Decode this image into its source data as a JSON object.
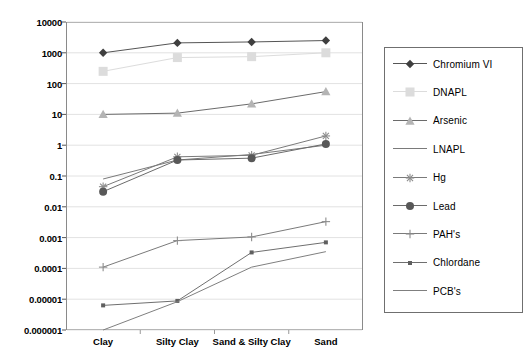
{
  "chart_data": {
    "type": "line",
    "title": "",
    "xlabel": "",
    "ylabel": "",
    "scale": "log",
    "grid": true,
    "legend_position": "right",
    "categories": [
      "Clay",
      "Silty Clay",
      "Sand & Silty Clay",
      "Sand"
    ],
    "ylim": [
      1e-06,
      10000
    ],
    "ytick_labels": [
      "10000",
      "1000",
      "100",
      "10",
      "1",
      "0.1",
      "0.01",
      "0.001",
      "0.0001",
      "0.00001",
      "0.000001"
    ],
    "ytick_values": [
      10000,
      1000,
      100,
      10,
      1,
      0.1,
      0.01,
      0.001,
      0.0001,
      1e-05,
      1e-06
    ],
    "series": [
      {
        "name": "Chromium VI",
        "marker": "diamond",
        "color": "#3f3f3f",
        "line_color": "#555555",
        "values": [
          1000,
          2100,
          2250,
          2500
        ]
      },
      {
        "name": "DNAPL",
        "marker": "square",
        "color": "#dcdcdc",
        "line_color": "#dcdcdc",
        "values": [
          250,
          700,
          750,
          1000
        ]
      },
      {
        "name": "Arsenic",
        "marker": "triangle",
        "color": "#b4b4b4",
        "line_color": "#6b6b6b",
        "values": [
          10,
          11,
          22,
          55
        ]
      },
      {
        "name": "LNAPL",
        "marker": "none",
        "color": "#7a7a7a",
        "line_color": "#7a7a7a",
        "values": [
          0.08,
          0.33,
          0.5,
          1.0
        ]
      },
      {
        "name": "Hg",
        "marker": "asterisk",
        "color": "#8c8c8c",
        "line_color": "#7a7a7a",
        "values": [
          0.045,
          0.42,
          0.47,
          2.0
        ]
      },
      {
        "name": "Lead",
        "marker": "circle",
        "color": "#585858",
        "line_color": "#6b6b6b",
        "values": [
          0.031,
          0.33,
          0.38,
          1.1
        ]
      },
      {
        "name": "PAH's",
        "marker": "plus",
        "color": "#8c8c8c",
        "line_color": "#7a7a7a",
        "values": [
          0.00011,
          0.0008,
          0.00105,
          0.0033
        ]
      },
      {
        "name": "Chlordane",
        "marker": "smallsquare",
        "color": "#5f5f5f",
        "line_color": "#6f6f6f",
        "values": [
          6.3e-06,
          8.8e-06,
          0.00033,
          0.0007
        ]
      },
      {
        "name": "PCB's",
        "marker": "none",
        "color": "#8a8a8a",
        "line_color": "#7f7f7f",
        "values": [
          8e-07,
          8.3e-06,
          0.00011,
          0.00035
        ]
      }
    ]
  },
  "legend": {
    "items": [
      {
        "label": "Chromium VI"
      },
      {
        "label": "DNAPL"
      },
      {
        "label": "Arsenic"
      },
      {
        "label": "LNAPL"
      },
      {
        "label": "Hg"
      },
      {
        "label": "Lead"
      },
      {
        "label": "PAH's"
      },
      {
        "label": "Chlordane"
      },
      {
        "label": "PCB's"
      }
    ]
  }
}
